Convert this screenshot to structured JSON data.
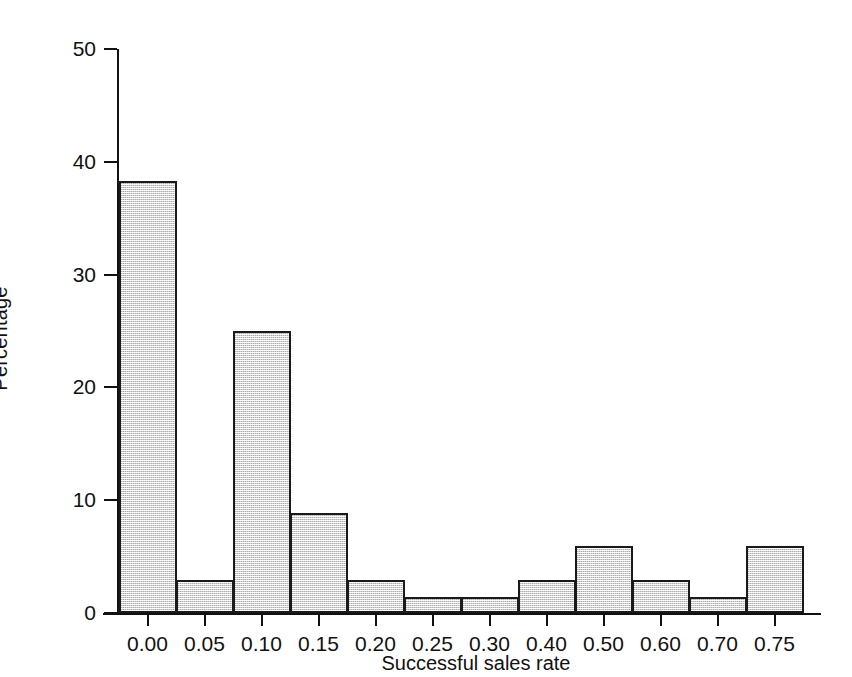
{
  "chart_data": {
    "type": "bar",
    "title": "",
    "subtitle": "",
    "xlabel": "Successful sales rate",
    "ylabel": "Percentage",
    "categories": [
      "0.00",
      "0.05",
      "0.10",
      "0.15",
      "0.20",
      "0.25",
      "0.30",
      "0.40",
      "0.50",
      "0.60",
      "0.70",
      "0.75"
    ],
    "values": [
      38.3,
      2.9,
      25.0,
      8.9,
      2.9,
      1.4,
      1.4,
      2.9,
      5.9,
      2.9,
      1.4,
      5.9
    ],
    "ylim": [
      0,
      50
    ],
    "yticks": [
      0,
      10,
      20,
      30,
      40,
      50
    ],
    "ytick_labels": [
      "0",
      "10",
      "20",
      "30",
      "40",
      "50"
    ],
    "grid": false,
    "legend": "none",
    "bar_style": {
      "fill": "#d4d4d4",
      "edge": "#1a1a1a",
      "pattern": "fine-dotted-stipple",
      "gap": 0
    },
    "axis_color": "#111111",
    "background": "#ffffff"
  }
}
